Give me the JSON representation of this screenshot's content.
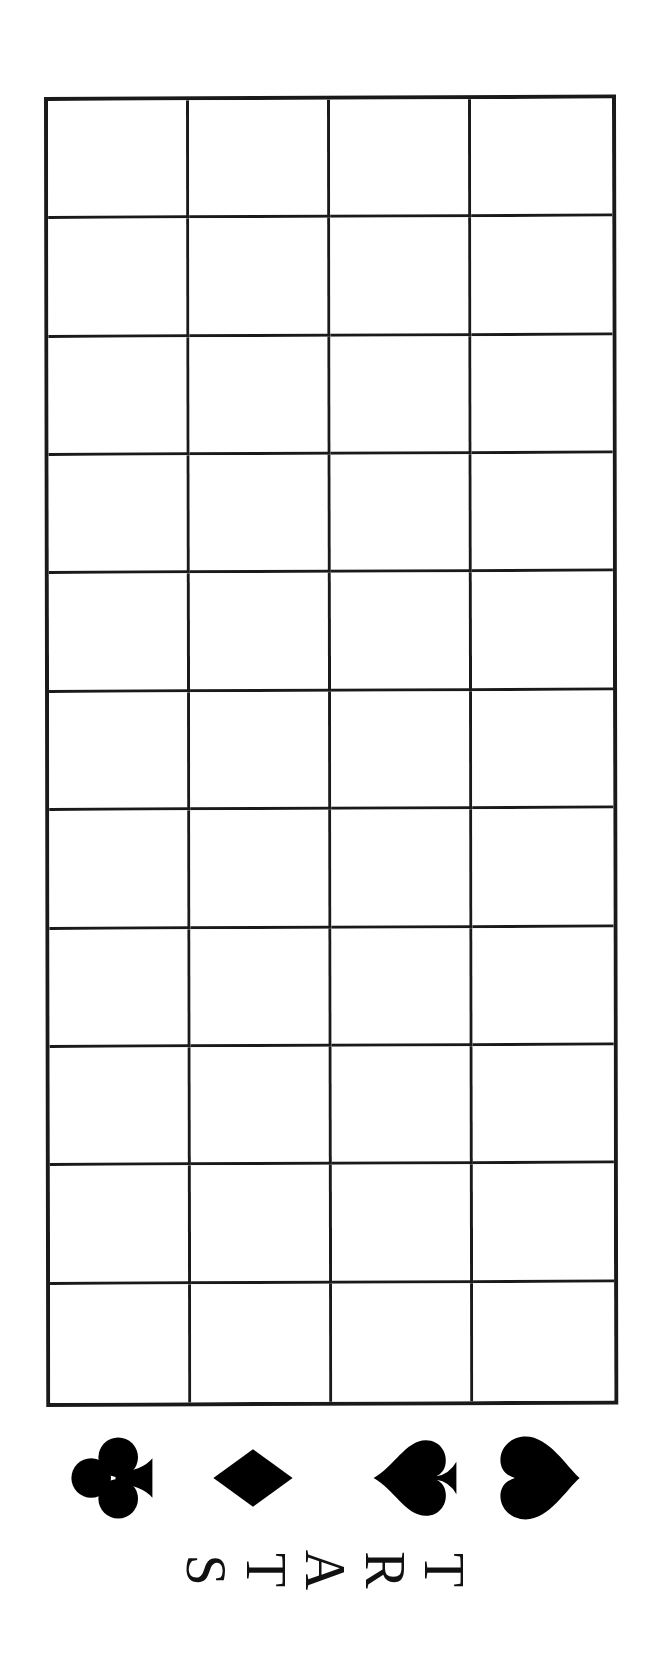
{
  "board": {
    "rows": 11,
    "columns": 4,
    "line_color": "#1a1a1a",
    "background": "#ffffff"
  },
  "suits": [
    {
      "name": "clubs",
      "glyph": "club-icon",
      "color": "#000000"
    },
    {
      "name": "diamonds",
      "glyph": "diamond-icon",
      "color": "#000000"
    },
    {
      "name": "spades",
      "glyph": "spade-icon",
      "color": "#000000"
    },
    {
      "name": "hearts",
      "glyph": "heart-icon",
      "color": "#000000"
    }
  ],
  "start_label": {
    "text": "START",
    "letters": [
      "S",
      "T",
      "A",
      "R",
      "T"
    ]
  }
}
